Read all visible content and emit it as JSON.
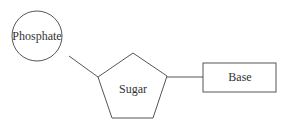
{
  "diagram": {
    "nodes": [
      {
        "id": "phosphate",
        "label": "Phosphate",
        "shape": "circle"
      },
      {
        "id": "sugar",
        "label": "Sugar",
        "shape": "pentagon"
      },
      {
        "id": "base",
        "label": "Base",
        "shape": "rectangle"
      }
    ],
    "edges": [
      {
        "from": "phosphate",
        "to": "sugar"
      },
      {
        "from": "sugar",
        "to": "base"
      }
    ],
    "colors": {
      "stroke": "#555555",
      "text": "#333333",
      "background": "#ffffff"
    }
  }
}
